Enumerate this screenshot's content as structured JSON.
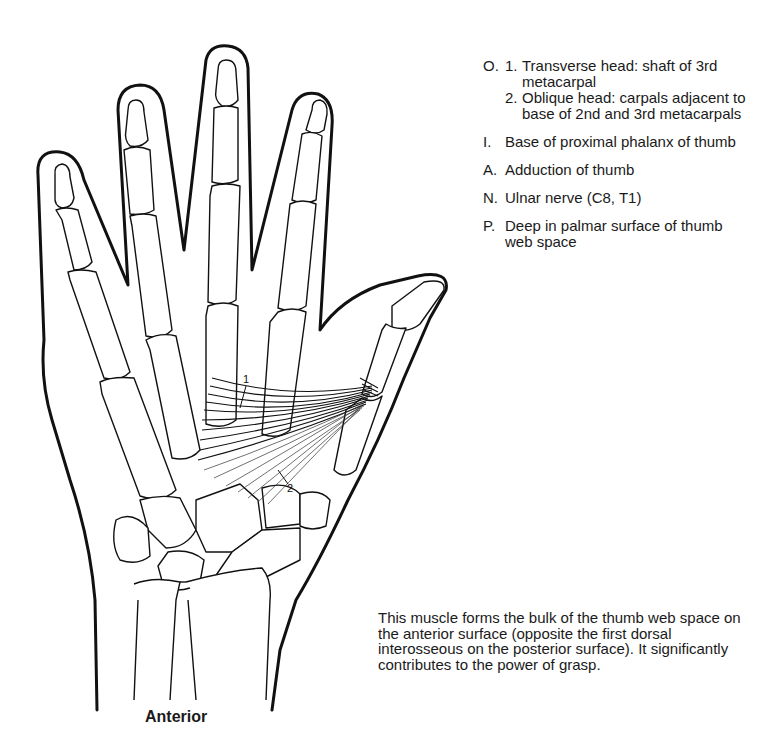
{
  "figure": {
    "view_label": "Anterior",
    "markers": {
      "transverse_head": "1",
      "oblique_head": "2"
    },
    "colors": {
      "line": "#111111",
      "background": "#ffffff",
      "text": "#1a1a1a"
    }
  },
  "legend": {
    "origin": {
      "key": "O.",
      "items": [
        {
          "num": "1.",
          "text": "Transverse head: shaft of 3rd metacarpal"
        },
        {
          "num": "2.",
          "text": "Oblique head: carpals adjacent to base of 2nd and 3rd metacarpals"
        }
      ]
    },
    "insertion": {
      "key": "I.",
      "text": "Base of proximal phalanx of thumb"
    },
    "action": {
      "key": "A.",
      "text": "Adduction of thumb"
    },
    "nerve": {
      "key": "N.",
      "text": "Ulnar nerve (C8, T1)"
    },
    "palpation": {
      "key": "P.",
      "text": "Deep in palmar surface of thumb web space"
    }
  },
  "description": "This muscle forms the bulk of the thumb web space on the anterior surface (opposite the first dorsal interosseous on the posterior surface). It significantly contributes to the power of grasp."
}
